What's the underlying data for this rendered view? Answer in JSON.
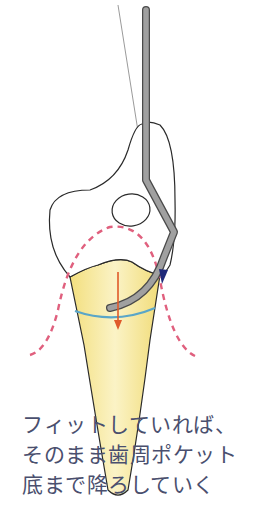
{
  "diagram": {
    "colors": {
      "root_fill": "#f7e79a",
      "root_fill_light": "#fbf4cc",
      "outline": "#2a2a2a",
      "instrument": "#9a9a9a",
      "instrument_edge": "#4a4a4a",
      "gingiva_dashed": "#e0607e",
      "attachment_line": "#5aa6c8",
      "direction_arrow": "#e05a2a",
      "contact_marker": "#1f2a7a",
      "caption_text": "#4a4f6e"
    }
  },
  "caption": {
    "lines": [
      "フィットしていれば、",
      "そのまま歯周ポケット",
      "底まで降ろしていく"
    ]
  }
}
